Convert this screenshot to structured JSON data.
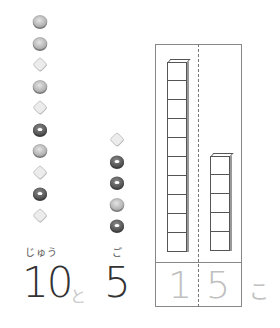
{
  "left_group": {
    "count_label": "10",
    "reading": "じゅう",
    "cookies": [
      "round",
      "round",
      "square",
      "round",
      "square",
      "ring",
      "round",
      "square",
      "ring",
      "square"
    ]
  },
  "connector": "と",
  "right_group": {
    "count_label": "5",
    "reading": "ご",
    "cookies": [
      "square",
      "ring",
      "ring",
      "round",
      "ring"
    ]
  },
  "place_value_chart": {
    "tens_blocks": 10,
    "ones_blocks": 5,
    "answer_tens_digit": "1",
    "answer_ones_digit": "5",
    "trailing_text": "こ"
  },
  "colors": {
    "line": "#888888",
    "trace_text": "#c0c0c0",
    "number_text": "#333333"
  }
}
